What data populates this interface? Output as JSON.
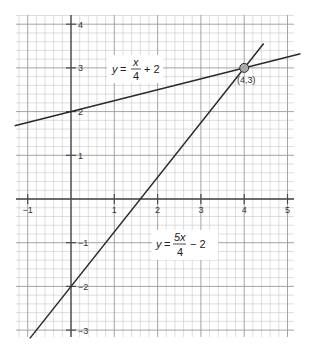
{
  "chart_data": {
    "type": "line",
    "title": "",
    "xlabel": "",
    "ylabel": "",
    "xlim": [
      -1.3,
      5.3
    ],
    "ylim": [
      -3.2,
      4.2
    ],
    "grid": true,
    "grid_minor_step": 0.2,
    "x_ticks": [
      -1,
      1,
      2,
      3,
      4,
      5
    ],
    "x_tick_labels": [
      "−1",
      "1",
      "2",
      "3",
      "4",
      "5"
    ],
    "y_ticks": [
      4,
      3,
      2,
      1,
      -1,
      -2,
      -3
    ],
    "y_tick_labels": [
      "4",
      "3",
      "2",
      "1",
      "−1",
      "−2",
      "−3"
    ],
    "series": [
      {
        "name": "y = x/4 + 2",
        "slope": 0.25,
        "intercept": 2,
        "x": [
          -1.3,
          5.3
        ],
        "y": [
          1.675,
          3.325
        ]
      },
      {
        "name": "y = 5x/4 − 2",
        "slope": 1.25,
        "intercept": -2,
        "x": [
          -0.95,
          4.45
        ],
        "y": [
          -3.19,
          3.56
        ]
      }
    ],
    "annotations": [
      {
        "type": "point",
        "x": 4,
        "y": 3,
        "label": "(4,3)"
      }
    ],
    "labels": {
      "line1": {
        "y": "y",
        "eq": "=",
        "num": "x",
        "den": "4",
        "rest": "+ 2"
      },
      "line2": {
        "y": "y",
        "eq": "=",
        "num": "5x",
        "den": "4",
        "rest": "− 2"
      }
    },
    "colors": {
      "line": "#2a2a2a",
      "axis": "#4a4a4a",
      "grid_minor": "#c8c8c8",
      "grid_major": "#9a9a9a",
      "point_fill": "#a8a8a8"
    }
  }
}
